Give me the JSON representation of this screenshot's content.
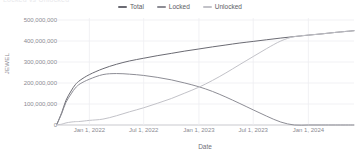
{
  "chart_title": "Locked vs Unlocked",
  "legend": {
    "position": "top-center",
    "items": [
      {
        "label": "Total",
        "color": "#6b6b73",
        "name": "legend-item-total"
      },
      {
        "label": "Locked",
        "color": "#8d8d95",
        "name": "legend-item-locked"
      },
      {
        "label": "Unlocked",
        "color": "#c2c2c8",
        "name": "legend-item-unlocked"
      }
    ]
  },
  "axes": {
    "x_title": "Date",
    "y_title": "JEWEL",
    "y_ticks": [
      "0",
      "100,000,000",
      "200,000,000",
      "300,000,000",
      "400,000,000",
      "500,000,000"
    ],
    "x_ticks": [
      "Jan 1, 2022",
      "Jul 1, 2022",
      "Jan 1, 2023",
      "Jul 1, 2023",
      "Jan 1, 2024"
    ]
  },
  "chart_data": {
    "type": "line",
    "title": "Locked vs Unlocked",
    "xlabel": "Date",
    "ylabel": "JEWEL",
    "ylim": [
      0,
      500000000
    ],
    "xlim": [
      "2021-09-15",
      "2024-06-01"
    ],
    "grid": true,
    "legend_position": "top-center",
    "x_tick_labels": [
      "Jan 1, 2022",
      "Jul 1, 2022",
      "Jan 1, 2023",
      "Jul 1, 2023",
      "Jan 1, 2024"
    ],
    "y_tick_values": [
      0,
      100000000,
      200000000,
      300000000,
      400000000,
      500000000
    ],
    "x": [
      "2021-09-15",
      "2021-10-01",
      "2021-10-15",
      "2021-11-01",
      "2021-11-15",
      "2021-12-01",
      "2022-01-01",
      "2022-02-15",
      "2022-04-01",
      "2022-05-15",
      "2022-07-01",
      "2022-08-15",
      "2022-10-01",
      "2022-11-15",
      "2023-01-01",
      "2023-02-15",
      "2023-04-01",
      "2023-05-15",
      "2023-07-01",
      "2023-08-15",
      "2023-10-01",
      "2023-11-15",
      "2024-01-01",
      "2024-02-15",
      "2024-04-01",
      "2024-06-01"
    ],
    "series": [
      {
        "name": "Total",
        "color": "#6b6b73",
        "values": [
          5000000,
          60000000,
          118000000,
          162000000,
          192000000,
          213000000,
          240000000,
          268000000,
          289000000,
          305000000,
          318000000,
          330000000,
          341000000,
          352000000,
          362000000,
          372000000,
          381000000,
          390000000,
          398000000,
          406000000,
          414000000,
          421000000,
          428000000,
          434000000,
          441000000,
          449000000
        ]
      },
      {
        "name": "Locked",
        "color": "#8d8d95",
        "values": [
          4000000,
          56000000,
          108000000,
          148000000,
          176000000,
          196000000,
          218000000,
          240000000,
          245000000,
          242000000,
          236000000,
          227000000,
          215000000,
          200000000,
          182000000,
          160000000,
          133000000,
          104000000,
          72000000,
          42000000,
          14000000,
          0,
          0,
          0,
          0,
          0
        ]
      },
      {
        "name": "Unlocked",
        "color": "#c2c2c8",
        "values": [
          1000000,
          4000000,
          10000000,
          14000000,
          16000000,
          17000000,
          22000000,
          28000000,
          44000000,
          63000000,
          82000000,
          103000000,
          126000000,
          152000000,
          180000000,
          212000000,
          248000000,
          286000000,
          326000000,
          364000000,
          400000000,
          421000000,
          428000000,
          434000000,
          441000000,
          449000000
        ]
      }
    ]
  }
}
